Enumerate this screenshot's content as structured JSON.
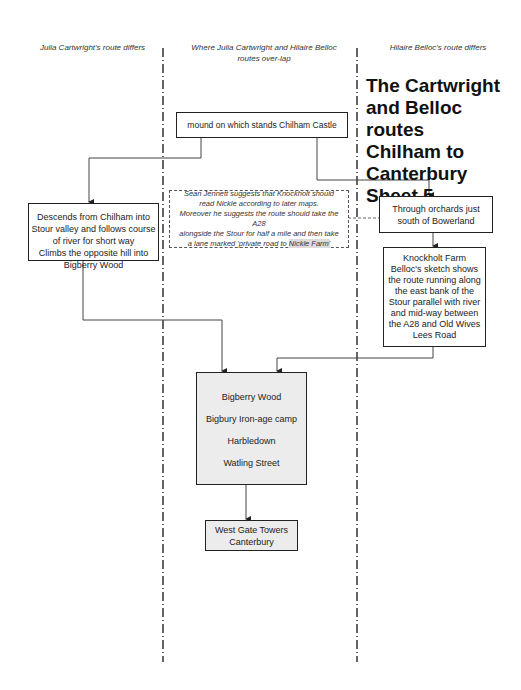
{
  "columns": {
    "left_heading": "Julia Cartwright's  route differs",
    "center_heading": "Where Julia Cartwright  and Hilaire Belloc routes over-lap",
    "right_heading": "Hilaire Belloc's route differs"
  },
  "title": {
    "line1": "The Cartwright",
    "line2": "and Belloc routes",
    "line3": "Chilham to",
    "line4": "Canterbury",
    "line5": "Sheet 5"
  },
  "nodes": {
    "start": "mound on which stands Chilham Castle",
    "cartwright": {
      "line1": "Descends from Chilham into",
      "line2": "Stour valley and follows course",
      "line3": "of river  for short way",
      "line4": "Climbs the opposite hill into",
      "line5": "Bigberry Wood"
    },
    "belloc_orchards": {
      "line1": "Through  orchards just",
      "line2": "south of Bowerland"
    },
    "belloc_knockholt": {
      "line1": "Knockholt Farm",
      "line2": "Belloc's sketch shows",
      "line3": "the route running along",
      "line4": "the east bank of the",
      "line5": "Stour parallel  with river",
      "line6": "and mid-way between",
      "line7": "the A28 and Old Wives",
      "line8": "Lees Road"
    },
    "merged": {
      "item1": "Bigberry Wood",
      "item2": "Bigbury Iron-age  camp",
      "item3": "Harbledown",
      "item4": "Watling Street"
    },
    "end": {
      "line1": "West Gate Towers",
      "line2": "Canterbury"
    }
  },
  "note": {
    "line1": "Sean Jennett suggests that Knockholt should",
    "line2": "read Nickle according to later maps.",
    "line3": "Moreover he  suggests the route should take the A28",
    "line4": "alongside the Stour for half a mile and then take",
    "line5_prefix": "a lane marked 'private road to ",
    "line5_highlight": "Nickle Farm'"
  },
  "colors": {
    "line": "#444444",
    "box_border": "#222222",
    "grey_fill": "#ececec",
    "highlight": "#dcdcdc"
  }
}
